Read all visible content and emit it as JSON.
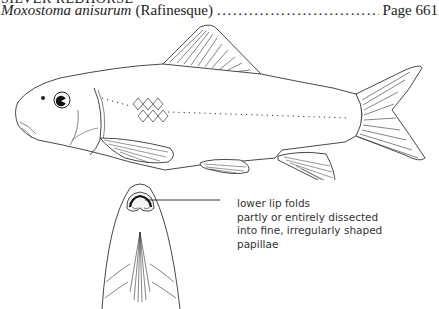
{
  "header": {
    "common_name": "SILVER REDHORSE",
    "scientific_name": "Moxostoma anisurum",
    "author": "(Rafinesque)",
    "leader_dots": "..............................................................................",
    "page_label": "Page 661"
  },
  "illustration": {
    "subject": "fish-lateral-view",
    "inset": "mouth-ventral-view"
  },
  "caption": {
    "lines": [
      "lower lip folds",
      "partly or entirely dissected",
      "into fine, irregularly shaped",
      "papillae"
    ]
  }
}
